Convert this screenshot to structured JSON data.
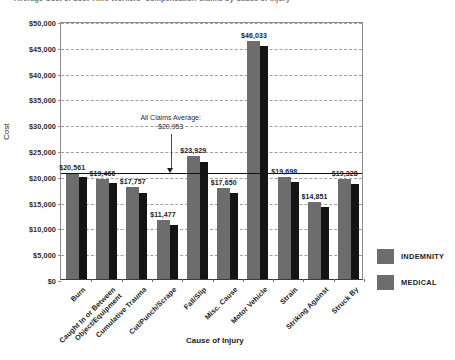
{
  "chart_data": {
    "type": "bar",
    "title": "Average Cost of Lost-Time Workers' Compensation Claims by Cause of Injury",
    "xlabel": "Cause of Injury",
    "ylabel": "Cost",
    "ylim": [
      0,
      50000
    ],
    "ytick_step": 5000,
    "ytick_labels": [
      "$0",
      "$5,000",
      "$10,000",
      "$15,000",
      "$20,000",
      "$25,000",
      "$30,000",
      "$35,000",
      "$40,000",
      "$45,000",
      "$50,000"
    ],
    "grid": "horizontal-dashed",
    "legend_position": "right",
    "categories": [
      "Burn",
      "Caught In or Between Object/Equipment",
      "Cumulative Trauma",
      "Cut/Punch/Scrape",
      "Fall/Slip",
      "Misc. Cause",
      "Motor Vehicle",
      "Strain",
      "Striking Against",
      "Struck By"
    ],
    "category_lines": [
      [
        "Burn",
        ""
      ],
      [
        "Caught In or Between",
        "Object/Equipment"
      ],
      [
        "Cumulative Trauma",
        ""
      ],
      [
        "Cut/Punch/Scrape",
        ""
      ],
      [
        "Fall/Slip",
        ""
      ],
      [
        "Misc. Cause",
        ""
      ],
      [
        "Motor Vehicle",
        ""
      ],
      [
        "Strain",
        ""
      ],
      [
        "Striking Against",
        ""
      ],
      [
        "Struck By",
        ""
      ]
    ],
    "series": [
      {
        "name": "INDEMNITY",
        "color": "#6d6d6d",
        "values": [
          20561,
          19466,
          17757,
          11477,
          23929,
          17650,
          46033,
          19698,
          14851,
          19328
        ]
      },
      {
        "name": "MEDICAL",
        "color": "#141414",
        "values": [
          19800,
          18600,
          16700,
          10500,
          22700,
          16700,
          45100,
          18800,
          13900,
          18400
        ]
      }
    ],
    "data_labels": [
      "$20,561",
      "$19,466",
      "$17,757",
      "$11,477",
      "$23,929",
      "$17,650",
      "$46,033",
      "$19,698",
      "$14,851",
      "$19,328"
    ],
    "annotations": [
      {
        "name": "all-claims-average",
        "line1": "All Claims Average:",
        "line2": "$20,953",
        "value": 20953
      }
    ]
  },
  "legend": {
    "items": [
      {
        "label": "INDEMNITY",
        "color": "#6d6d6d"
      },
      {
        "label": "MEDICAL",
        "color": "#6d6d6d"
      }
    ]
  }
}
